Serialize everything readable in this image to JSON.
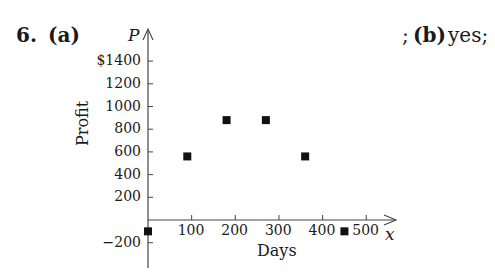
{
  "problem": {
    "number": "6.",
    "part_a_label": "(a)",
    "answer_b_prefix": ";",
    "part_b_label": "(b)",
    "answer_b_text": "yes;"
  },
  "chart_data": {
    "type": "scatter",
    "title": "",
    "xlabel": "Days",
    "ylabel": "Profit",
    "x_axis_variable": "x",
    "y_axis_variable": "P",
    "xlim": [
      0,
      550
    ],
    "ylim": [
      -300,
      1500
    ],
    "x_ticks": [
      100,
      200,
      300,
      400,
      500
    ],
    "x_tick_labels": [
      "100",
      "200",
      "300",
      "400",
      "500"
    ],
    "y_ticks": [
      1400,
      1200,
      1000,
      800,
      600,
      400,
      200,
      -200
    ],
    "y_tick_labels": [
      "$1400",
      "1200",
      "1000",
      "800",
      "600",
      "400",
      "200",
      "−200"
    ],
    "grid": false,
    "legend": null,
    "marker": "square",
    "marker_color": "#111111",
    "series": [
      {
        "name": "Profit",
        "x": [
          0,
          90,
          180,
          270,
          360,
          450
        ],
        "y": [
          -100,
          560,
          880,
          880,
          560,
          -100
        ]
      }
    ]
  }
}
